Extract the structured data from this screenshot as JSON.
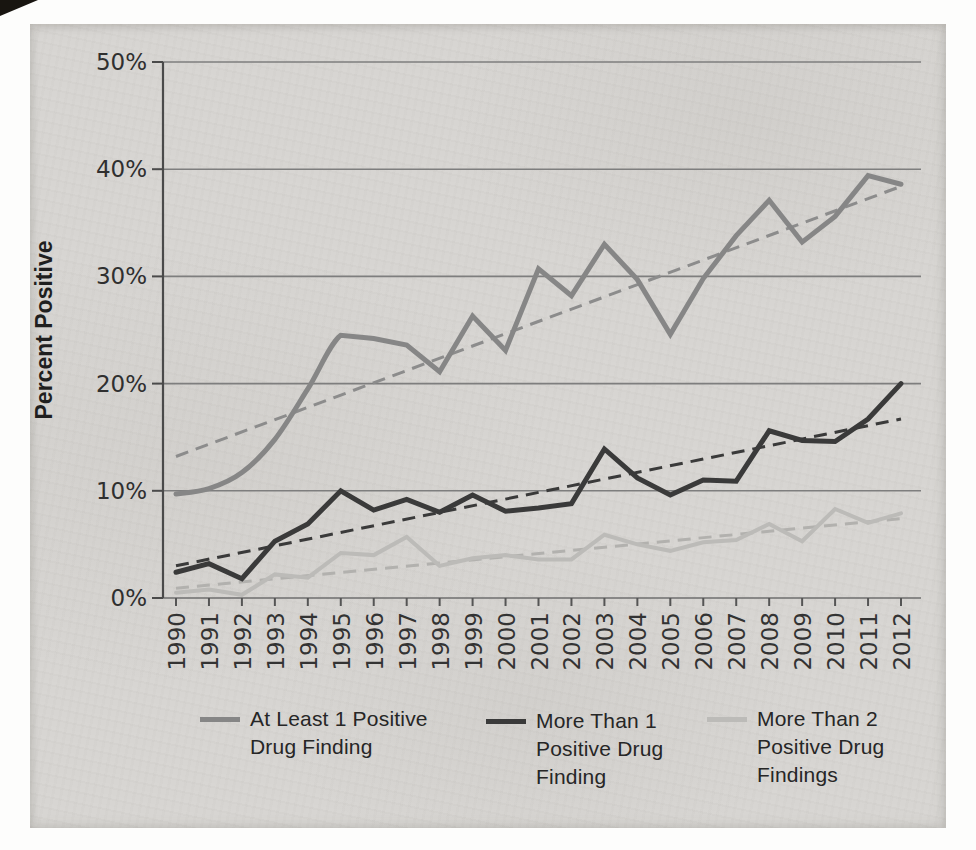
{
  "page": {
    "margin_color": "#fdfdfc",
    "scan_background": "#d7d5d2",
    "artifacts": [
      "dark-scan-corner-top-left"
    ]
  },
  "chart_data": {
    "type": "line",
    "ylabel": "Percent Positive",
    "ylim": [
      0,
      50
    ],
    "ytick_labels": [
      "0%",
      "10%",
      "20%",
      "30%",
      "40%",
      "50%"
    ],
    "grid": "horizontal",
    "legend_position": "bottom",
    "x": [
      1990,
      1991,
      1992,
      1993,
      1994,
      1995,
      1996,
      1997,
      1998,
      1999,
      2000,
      2001,
      2002,
      2003,
      2004,
      2005,
      2006,
      2007,
      2008,
      2009,
      2010,
      2011,
      2012
    ],
    "series": [
      {
        "name": "At Least 1 Positive Drug Finding",
        "type": "solid",
        "color": "#868686",
        "stroke_width": 5,
        "smooth_start": true,
        "values": [
          9.7,
          10.2,
          11.7,
          14.8,
          19.5,
          24.5,
          24.2,
          23.6,
          21.1,
          26.3,
          23.1,
          30.7,
          28.2,
          33.0,
          29.7,
          24.6,
          29.8,
          33.8,
          37.1,
          33.2,
          35.6,
          39.4,
          38.6
        ]
      },
      {
        "name": "More Than 1 Positive Drug Finding",
        "type": "solid",
        "color": "#3a3a3a",
        "stroke_width": 5,
        "smooth_start": false,
        "values": [
          2.4,
          3.2,
          1.8,
          5.3,
          6.9,
          10.0,
          8.2,
          9.2,
          8.0,
          9.6,
          8.1,
          8.4,
          8.8,
          13.9,
          11.2,
          9.6,
          11.0,
          10.9,
          15.6,
          14.7,
          14.6,
          16.7,
          20.0
        ]
      },
      {
        "name": "More Than 2 Positive Drug Findings",
        "type": "solid",
        "color": "#bcbbb8",
        "stroke_width": 4,
        "smooth_start": false,
        "values": [
          0.5,
          0.8,
          0.3,
          2.2,
          1.9,
          4.2,
          4.0,
          5.7,
          3.0,
          3.7,
          4.0,
          3.6,
          3.6,
          5.9,
          5.0,
          4.4,
          5.2,
          5.4,
          6.9,
          5.3,
          8.3,
          7.0,
          7.9
        ]
      },
      {
        "name": "Linear trend (At Least 1 Positive Drug Finding)",
        "type": "dashed-trend",
        "color": "#8c8c8c",
        "stroke_width": 3,
        "endpoints": [
          13.2,
          38.4
        ]
      },
      {
        "name": "Linear trend (More Than 1 Positive Drug Finding)",
        "type": "dashed-trend",
        "color": "#3a3a3a",
        "stroke_width": 3,
        "endpoints": [
          3.0,
          16.7
        ]
      },
      {
        "name": "Linear trend (More Than 2 Positive Drug Findings)",
        "type": "dashed-trend",
        "color": "#b2b1ae",
        "stroke_width": 3,
        "endpoints": [
          0.9,
          7.4
        ]
      }
    ]
  },
  "legend": {
    "items": [
      {
        "label": "At Least 1 Positive\nDrug Finding",
        "color": "#868686"
      },
      {
        "label": "More Than 1\nPositive Drug\nFinding",
        "color": "#3a3a3a"
      },
      {
        "label": "More Than 2\nPositive Drug\nFindings",
        "color": "#bcbbb8"
      }
    ]
  }
}
